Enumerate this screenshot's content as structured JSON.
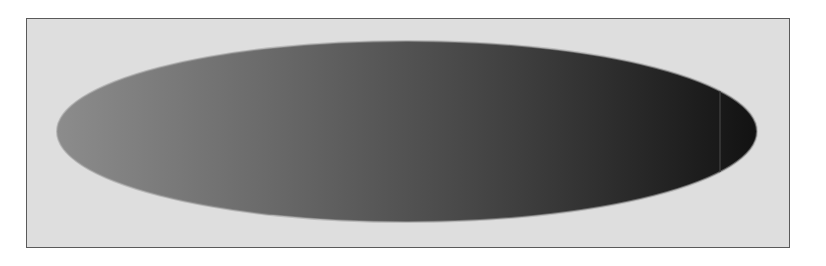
{
  "canvas": {
    "width": 826,
    "height": 266,
    "page_background": "#ffffff"
  },
  "frame": {
    "background": "#dedede",
    "border_color": "#5a5a5a"
  },
  "shape": {
    "type": "ellipse",
    "cx": 407,
    "cy": 131.5,
    "rx": 350,
    "ry": 90.5,
    "gradient": {
      "direction": "horizontal",
      "stops": [
        {
          "offset": "0%",
          "color": "#8c8c8c"
        },
        {
          "offset": "30%",
          "color": "#6a6a6a"
        },
        {
          "offset": "65%",
          "color": "#404040"
        },
        {
          "offset": "100%",
          "color": "#121212"
        }
      ]
    },
    "rim_color": "#9a9a9a",
    "highlight_line": {
      "x": 720,
      "color": "#3c3c3c"
    }
  }
}
